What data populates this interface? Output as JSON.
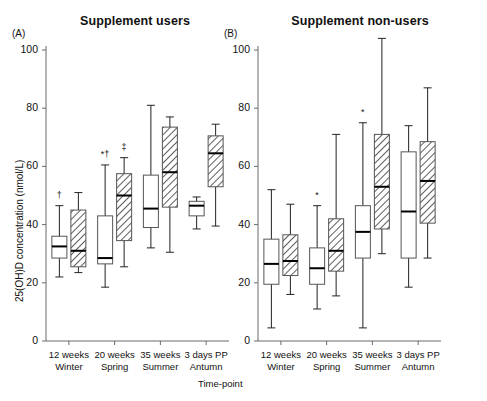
{
  "figure": {
    "ylabel": "25(OH)D concentration (nmol/L)",
    "xlabel": "Time-point",
    "yticks": [
      "0",
      "20",
      "40",
      "60",
      "80",
      "100"
    ],
    "panels": [
      {
        "letter": "(A)",
        "title": "Supplement users"
      },
      {
        "letter": "(B)",
        "title": "Supplement non-users"
      }
    ],
    "xticks": [
      {
        "line1": "12 weeks",
        "line2": "Winter"
      },
      {
        "line1": "20 weeks",
        "line2": "Spring"
      },
      {
        "line1": "35 weeks",
        "line2": "Summer"
      },
      {
        "line1": "3 days PP",
        "line2": "Antumn"
      }
    ]
  },
  "chart_data": {
    "type": "box",
    "xlabel": "Time-point",
    "ylabel": "25(OH)D concentration (nmol/L)",
    "ylim": [
      0,
      105
    ],
    "yticks": [
      0,
      20,
      40,
      60,
      80,
      100
    ],
    "categories": [
      "12 weeks Winter",
      "20 weeks Spring",
      "35 weeks Summer",
      "3 days PP Antumn"
    ],
    "grid": false,
    "legend": "none",
    "box_styles": [
      "open",
      "hatched"
    ],
    "panels": [
      {
        "letter": "(A)",
        "title": "Supplement users",
        "boxes": [
          {
            "category": "12 weeks Winter",
            "style": "open",
            "whisker_low": 22.0,
            "q1": 28.5,
            "median": 32.5,
            "q3": 36.0,
            "whisker_high": 46.5,
            "markers": "†"
          },
          {
            "category": "12 weeks Winter",
            "style": "hatched",
            "whisker_low": 23.5,
            "q1": 25.5,
            "median": 31.0,
            "q3": 45.0,
            "whisker_high": 51.0,
            "markers": ""
          },
          {
            "category": "20 weeks Spring",
            "style": "open",
            "whisker_low": 18.5,
            "q1": 26.5,
            "median": 28.5,
            "q3": 43.0,
            "whisker_high": 60.5,
            "markers": "*†"
          },
          {
            "category": "20 weeks Spring",
            "style": "hatched",
            "whisker_low": 25.5,
            "q1": 34.5,
            "median": 50.0,
            "q3": 57.5,
            "whisker_high": 63.0,
            "markers": "‡"
          },
          {
            "category": "35 weeks Summer",
            "style": "open",
            "whisker_low": 32.0,
            "q1": 39.0,
            "median": 45.5,
            "q3": 57.0,
            "whisker_high": 81.0,
            "markers": ""
          },
          {
            "category": "35 weeks Summer",
            "style": "hatched",
            "whisker_low": 30.5,
            "q1": 46.0,
            "median": 58.0,
            "q3": 73.5,
            "whisker_high": 77.0,
            "markers": ""
          },
          {
            "category": "3 days PP Antumn",
            "style": "open",
            "whisker_low": 38.5,
            "q1": 43.0,
            "median": 46.5,
            "q3": 48.0,
            "whisker_high": 49.5,
            "markers": ""
          },
          {
            "category": "3 days PP Antumn",
            "style": "hatched",
            "whisker_low": 39.5,
            "q1": 53.0,
            "median": 64.5,
            "q3": 70.5,
            "whisker_high": 74.5,
            "markers": ""
          }
        ]
      },
      {
        "letter": "(B)",
        "title": "Supplement non-users",
        "boxes": [
          {
            "category": "12 weeks Winter",
            "style": "open",
            "whisker_low": 4.5,
            "q1": 19.5,
            "median": 26.5,
            "q3": 35.0,
            "whisker_high": 52.0,
            "markers": ""
          },
          {
            "category": "12 weeks Winter",
            "style": "hatched",
            "whisker_low": 16.0,
            "q1": 22.5,
            "median": 27.5,
            "q3": 36.5,
            "whisker_high": 47.0,
            "markers": ""
          },
          {
            "category": "20 weeks Spring",
            "style": "open",
            "whisker_low": 11.0,
            "q1": 19.5,
            "median": 25.0,
            "q3": 32.0,
            "whisker_high": 46.5,
            "markers": "*"
          },
          {
            "category": "20 weeks Spring",
            "style": "hatched",
            "whisker_low": 15.5,
            "q1": 24.0,
            "median": 31.0,
            "q3": 42.0,
            "whisker_high": 71.0,
            "markers": ""
          },
          {
            "category": "35 weeks Summer",
            "style": "open",
            "whisker_low": 4.5,
            "q1": 28.5,
            "median": 37.5,
            "q3": 46.5,
            "whisker_high": 75.0,
            "markers": "*"
          },
          {
            "category": "35 weeks Summer",
            "style": "hatched",
            "whisker_low": 30.0,
            "q1": 38.5,
            "median": 53.0,
            "q3": 71.0,
            "whisker_high": 104.0,
            "markers": ""
          },
          {
            "category": "3 days PP Antumn",
            "style": "open",
            "whisker_low": 18.5,
            "q1": 28.5,
            "median": 44.5,
            "q3": 65.0,
            "whisker_high": 74.0,
            "markers": ""
          },
          {
            "category": "3 days PP Antumn",
            "style": "hatched",
            "whisker_low": 28.5,
            "q1": 40.5,
            "median": 55.0,
            "q3": 68.5,
            "whisker_high": 87.0,
            "markers": ""
          }
        ]
      }
    ]
  }
}
